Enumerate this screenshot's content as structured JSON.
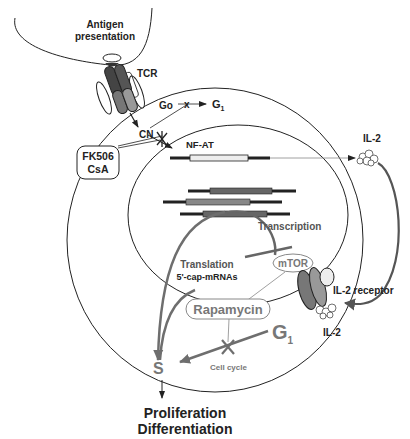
{
  "antigen": {
    "line1": "Antigen",
    "line2": "presentation"
  },
  "tcr": {
    "label": "TCR"
  },
  "cell_cycle_top": {
    "go": "Go",
    "g1_main": "G",
    "g1_sub": "1"
  },
  "cn": {
    "label": "CN"
  },
  "drug_box": {
    "line1": "FK506",
    "line2": "CsA"
  },
  "nfat": {
    "label": "NF-AT"
  },
  "il2_top": {
    "label": "IL-2"
  },
  "transcription": {
    "label": "Transcription"
  },
  "translation": {
    "line1": "Translation",
    "line2": "5'-cap-mRNAs"
  },
  "mtor": {
    "label": "mTOR"
  },
  "rapamycin": {
    "label": "Rapamycin"
  },
  "il2_receptor": {
    "label": "IL-2 receptor"
  },
  "il2_bottom": {
    "label": "IL-2"
  },
  "cell_cycle_bottom": {
    "g1_main": "G",
    "g1_sub": "1",
    "s": "S",
    "caption": "Cell cycle"
  },
  "outcome": {
    "line1": "Proliferation",
    "line2": "Differentiation"
  },
  "colors": {
    "ink": "#222222",
    "grey_arrow": "#6e6e6e",
    "light_grey_text": "#777777"
  }
}
